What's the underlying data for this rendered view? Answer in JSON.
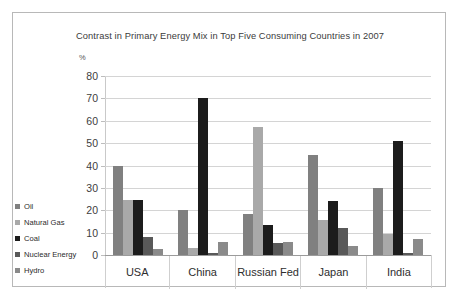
{
  "chart_data": {
    "type": "bar",
    "title": "Contrast in Primary Energy Mix in Top Five Consuming Countries in 2007",
    "xlabel": "",
    "ylabel": "%",
    "ylim": [
      0,
      80
    ],
    "ytick_step": 10,
    "yticks": [
      80,
      70,
      60,
      50,
      40,
      30,
      20,
      10,
      0
    ],
    "grid": true,
    "legend_position": "bottom-left",
    "categories": [
      "USA",
      "China",
      "Russian Fed",
      "Japan",
      "India"
    ],
    "series": [
      {
        "name": "Oil",
        "color": "#808080",
        "values": [
          40,
          20,
          18.5,
          44.5,
          30
        ]
      },
      {
        "name": "Natural Gas",
        "color": "#a9a9a9",
        "values": [
          24.5,
          3,
          57,
          15.5,
          9.5
        ]
      },
      {
        "name": "Coal",
        "color": "#1c1c1c",
        "values": [
          24.5,
          70,
          13.5,
          24,
          51
        ]
      },
      {
        "name": "Nuclear Energy",
        "color": "#595959",
        "values": [
          8,
          1,
          5.5,
          12,
          1
        ]
      },
      {
        "name": "Hydro",
        "color": "#8a8a8a",
        "values": [
          2.5,
          6,
          6,
          4,
          7
        ]
      }
    ]
  },
  "colors": {
    "frame_border": "#b8b8b8",
    "gridline": "#d4d4d4",
    "text": "#2e2e2e"
  }
}
